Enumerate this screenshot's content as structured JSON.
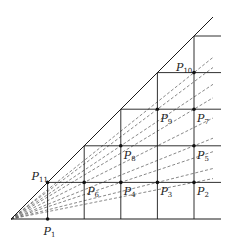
{
  "diagram": {
    "type": "geometric-construction",
    "origin": {
      "x": 11,
      "y": 219
    },
    "unit": 36.6,
    "grid_columns": 5,
    "grid_rows": 5,
    "ray_slopes": [
      0.8,
      0.75,
      0.6667,
      0.6,
      0.5,
      0.4,
      0.3333,
      0.25,
      0.2
    ],
    "points": [
      {
        "name": "P",
        "sub": "1",
        "i": 1,
        "j": 0,
        "label_dx": -4,
        "label_dy": 16
      },
      {
        "name": "P",
        "sub": "2",
        "i": 5,
        "j": 1,
        "label_dx": 3,
        "label_dy": 13
      },
      {
        "name": "P",
        "sub": "3",
        "i": 4,
        "j": 1,
        "label_dx": 3,
        "label_dy": 13
      },
      {
        "name": "P",
        "sub": "4",
        "i": 3,
        "j": 1,
        "label_dx": 3,
        "label_dy": 13
      },
      {
        "name": "P",
        "sub": "5",
        "i": 5,
        "j": 2,
        "label_dx": 3,
        "label_dy": 13
      },
      {
        "name": "P",
        "sub": "6",
        "i": 2,
        "j": 1,
        "label_dx": 3,
        "label_dy": 13
      },
      {
        "name": "P",
        "sub": "7",
        "i": 5,
        "j": 3,
        "label_dx": 3,
        "label_dy": 13
      },
      {
        "name": "P",
        "sub": "8",
        "i": 3,
        "j": 2,
        "label_dx": 3,
        "label_dy": 13
      },
      {
        "name": "P",
        "sub": "9",
        "i": 4,
        "j": 3,
        "label_dx": 3,
        "label_dy": 13
      },
      {
        "name": "P",
        "sub": "10",
        "i": 5,
        "j": 4,
        "label_dx": -18,
        "label_dy": -2
      },
      {
        "name": "P",
        "sub": "11",
        "i": 1,
        "j": 1,
        "label_dx": -16,
        "label_dy": -2
      }
    ],
    "colors": {
      "line": "#1a1a1a",
      "dash": "#555555",
      "point": "#111111"
    }
  }
}
